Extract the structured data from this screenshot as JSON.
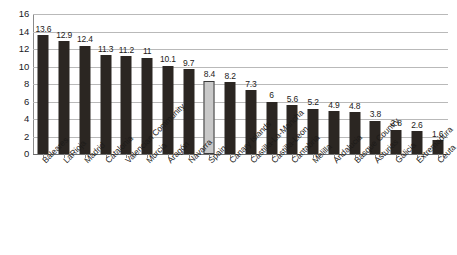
{
  "chart_data": {
    "type": "bar",
    "title": "",
    "subtitle": "",
    "xlabel": "",
    "ylabel": "",
    "ylim": [
      0,
      16
    ],
    "ytick_step": 2,
    "yticks": [
      0,
      2,
      4,
      6,
      8,
      10,
      12,
      14,
      16
    ],
    "grid": true,
    "legend": "none",
    "orientation": "vertical",
    "sorted": "descending",
    "categories": [
      "Baleares",
      "LaRioja",
      "Madrid",
      "Catalonia",
      "Valencian Community",
      "Murcia",
      "Aragón",
      "Navarra",
      "Spain",
      "Canary Islands",
      "Castilla-La-Mancha",
      "Castilla-Leon",
      "Cantabria",
      "Melilla",
      "Andalucia",
      "Basque Country",
      "Asturias",
      "Galicia",
      "Extremadura",
      "Ceuta"
    ],
    "values": [
      13.6,
      12.9,
      12.4,
      11.3,
      11.2,
      11,
      10.1,
      9.7,
      8.4,
      8.2,
      7.3,
      6,
      5.6,
      5.2,
      4.9,
      4.8,
      3.8,
      2.8,
      2.6,
      1.6
    ],
    "value_labels": [
      "13.6",
      "12.9",
      "12.4",
      "11.3",
      "11.2",
      "11",
      "10.1",
      "9.7",
      "8.4",
      "8.2",
      "7.3",
      "6",
      "5.6",
      "5.2",
      "4.9",
      "4.8",
      "3.8",
      "2.8",
      "2.6",
      "1.6"
    ],
    "highlight_index": 8,
    "highlight_category": "Spain",
    "colors": {
      "bar": "#2b2622",
      "bar_highlight_fill": "#c9c9c9",
      "bar_highlight_stroke": "#3a3a3a",
      "gridline": "#b9b9b9",
      "axis": "#8a8a8a",
      "text": "#1d1b19",
      "background": "#ffffff"
    }
  }
}
